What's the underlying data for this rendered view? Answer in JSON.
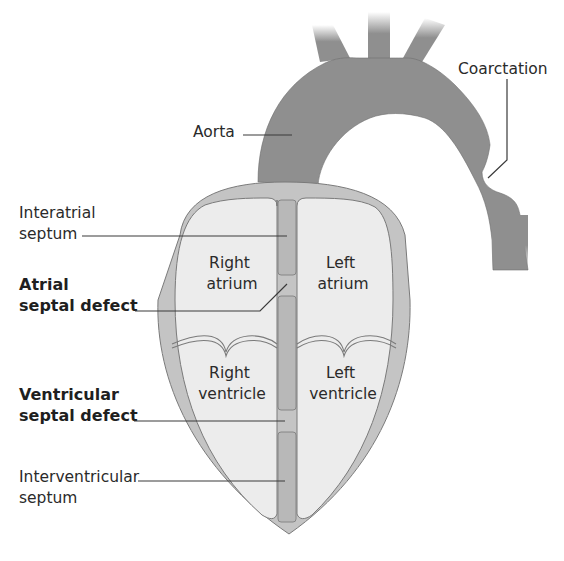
{
  "diagram": {
    "colors": {
      "background": "#ffffff",
      "aorta": "#8f8f8f",
      "heart_wall": "#c4c4c4",
      "chamber_fill": "#ececec",
      "septum": "#b8b8b8",
      "outline": "#7a7a7a",
      "text": "#2a2a2a"
    },
    "labels": {
      "aorta": "Aorta",
      "coarctation": "Coarctation",
      "interatrial_septum": {
        "line1": "Interatrial",
        "line2": "septum"
      },
      "atrial_septal_defect": {
        "line1": "Atrial",
        "line2": "septal defect"
      },
      "ventricular_septal_defect": {
        "line1": "Ventricular",
        "line2": "septal defect"
      },
      "interventricular_septum": {
        "line1": "Interventricular",
        "line2": "septum"
      }
    },
    "chambers": {
      "right_atrium": {
        "line1": "Right",
        "line2": "atrium"
      },
      "left_atrium": {
        "line1": "Left",
        "line2": "atrium"
      },
      "right_ventricle": {
        "line1": "Right",
        "line2": "ventricle"
      },
      "left_ventricle": {
        "line1": "Left",
        "line2": "ventricle"
      }
    }
  }
}
